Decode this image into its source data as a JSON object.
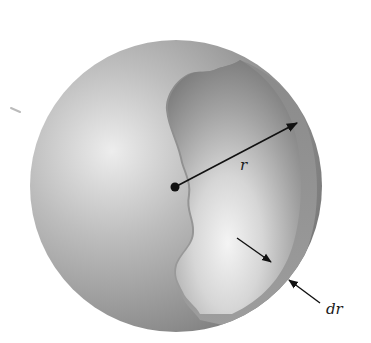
{
  "figure": {
    "labels": {
      "radius": "r",
      "thickness": "dr"
    },
    "colors": {
      "sphere_light": "#e2e2e2",
      "sphere_mid": "#9a9a9a",
      "sphere_dark": "#6e6e6e",
      "cavity_dark": "#7d7d7d",
      "cavity_light": "#efefef",
      "shell": "#8a8a8a",
      "arrow": "#111111"
    }
  }
}
